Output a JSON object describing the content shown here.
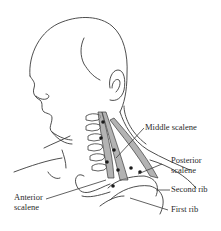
{
  "figure": {
    "type": "anatomical line drawing",
    "line_color": "#3a3a3a",
    "muscle_fill": "#9a9a9a",
    "dot_color": "#1a1a1a"
  },
  "labels": {
    "middle_scalene": {
      "line1": "Middle scalene"
    },
    "posterior_scalene": {
      "line1": "Posterior",
      "line2": "scalene"
    },
    "second_rib": {
      "line1": "Second rib"
    },
    "first_rib": {
      "line1": "First rib"
    },
    "anterior_scalene": {
      "line1": "Anterior",
      "line2": "scalene"
    }
  }
}
